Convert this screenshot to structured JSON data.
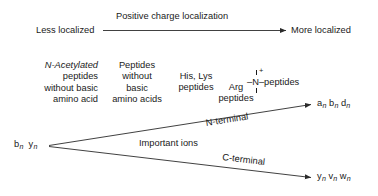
{
  "diagram": {
    "axis": {
      "left_label": "Less localized",
      "right_label": "More localized",
      "axis_title": "Positive charge localization"
    },
    "columns": [
      {
        "lines": [
          "N-Acetylated",
          "peptides",
          "without basic",
          "amino acid"
        ],
        "italic_first_char": "N"
      },
      {
        "lines": [
          "Peptides",
          "without",
          "basic",
          "amino acids"
        ]
      },
      {
        "lines": [
          "His, Lys",
          "peptides"
        ]
      },
      {
        "lines": [
          "Arg",
          "peptides"
        ]
      }
    ],
    "ammonium": {
      "left_bond": "–",
      "atom": "N",
      "charge": "+",
      "right_bond": "–",
      "label": "peptides"
    },
    "origin_ion": {
      "first": "b",
      "second": "y",
      "subscript": "n"
    },
    "branches": [
      {
        "label": "N-terminal",
        "target_ions": [
          "a",
          "b",
          "d"
        ],
        "subscript": "n"
      },
      {
        "label": "C-terminal",
        "target_ions": [
          "y",
          "v",
          "w"
        ],
        "subscript": "n"
      }
    ],
    "center_label": "Important ions",
    "colors": {
      "ink": "#1a1a1a",
      "background": "#ffffff",
      "line": "#2b2b2b"
    }
  }
}
